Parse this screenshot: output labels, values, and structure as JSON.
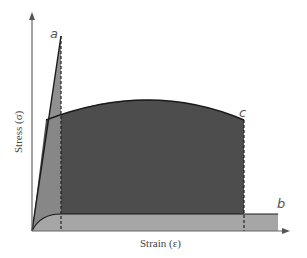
{
  "diagram": {
    "type": "stress-strain curves with toughness shading",
    "x_axis": {
      "label": "Strain (ε)"
    },
    "y_axis": {
      "label": "Stress (σ)"
    },
    "curves": [
      {
        "id": "a",
        "label": "a",
        "description": "brittle: steep linear rise to fracture at low strain",
        "fill": "#8a8a8a"
      },
      {
        "id": "b",
        "label": "b",
        "description": "ductile low-strength: low flat plateau to large strain",
        "fill": "#a6a6a6"
      },
      {
        "id": "c",
        "label": "c",
        "description": "tough: yields then hardens, large area under curve",
        "fill": "#4d4d4d"
      }
    ],
    "colors": {
      "axis": "#666666",
      "curve_line": "#1a1a1a",
      "region_a": "#8a8a8a",
      "region_c": "#4d4d4d",
      "region_b": "#a6a6a6",
      "dashed": "#222222"
    }
  }
}
